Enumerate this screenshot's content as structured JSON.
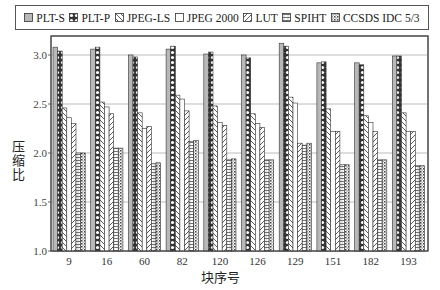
{
  "chart_data": {
    "type": "bar",
    "title": "",
    "xlabel": "块序号",
    "ylabel": "压缩比",
    "ylim": [
      1.0,
      3.2
    ],
    "yticks": [
      1.0,
      1.5,
      2.0,
      2.5,
      3.0
    ],
    "ytick_labels": [
      "1.0",
      "1.5",
      "2.0",
      "2.5",
      "3.0"
    ],
    "grid": "horizontal",
    "legend_position": "top",
    "categories": [
      "9",
      "16",
      "60",
      "82",
      "120",
      "126",
      "129",
      "151",
      "182",
      "193"
    ],
    "series": [
      {
        "name": "PLT-S",
        "pattern": "gray",
        "values": [
          3.08,
          3.06,
          3.0,
          3.06,
          3.01,
          3.0,
          3.12,
          2.92,
          2.92,
          2.99
        ]
      },
      {
        "name": "PLT-P",
        "pattern": "circles",
        "values": [
          3.04,
          3.08,
          2.98,
          3.09,
          3.03,
          2.97,
          3.09,
          2.93,
          2.9,
          2.99
        ]
      },
      {
        "name": "JPEG-LS",
        "pattern": "backslash",
        "values": [
          2.46,
          2.52,
          2.41,
          2.59,
          2.48,
          2.4,
          2.57,
          2.45,
          2.38,
          2.41
        ]
      },
      {
        "name": "JPEG 2000",
        "pattern": "blank",
        "values": [
          2.36,
          2.47,
          2.25,
          2.55,
          2.31,
          2.3,
          2.51,
          2.22,
          2.31,
          2.22
        ]
      },
      {
        "name": "LUT",
        "pattern": "slash",
        "values": [
          2.3,
          2.4,
          2.27,
          2.43,
          2.28,
          2.26,
          2.1,
          2.22,
          2.22,
          2.22
        ]
      },
      {
        "name": "SPIHT",
        "pattern": "hlines",
        "values": [
          2.0,
          2.05,
          1.89,
          2.12,
          1.93,
          1.93,
          2.08,
          1.88,
          1.93,
          1.87
        ]
      },
      {
        "name": "CCSDS IDC 5/3",
        "pattern": "dots",
        "values": [
          2.0,
          2.05,
          1.9,
          2.13,
          1.94,
          1.93,
          2.1,
          1.88,
          1.93,
          1.87
        ]
      }
    ]
  }
}
